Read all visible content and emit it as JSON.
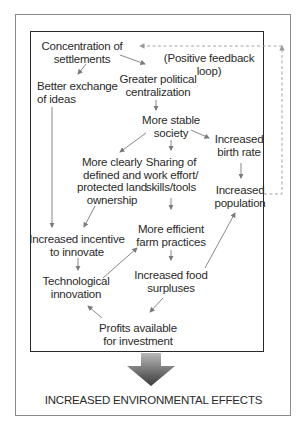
{
  "diagram": {
    "nodes": {
      "concentration": "Concentration of\nsettlements",
      "feedback_label": "(Positive feedback loop)",
      "better_exchange": "Better exchange\nof ideas",
      "political": "Greater political\ncentralization",
      "stable": "More stable\nsociety",
      "birth_rate": "Increased\nbirth rate",
      "land": "More clearly\ndefined and\nprotected land\nownership",
      "sharing": "Sharing of\nwork effort/\nskills/tools",
      "population": "Increased\npopulation",
      "incentive": "Increased incentive\nto innovate",
      "farm": "More efficient\nfarm practices",
      "tech": "Technological\ninnovation",
      "food": "Increased food\nsurpluses",
      "profits": "Profits available\nfor investment"
    },
    "outcome": "INCREASED ENVIRONMENTAL EFFECTS",
    "colors": {
      "text": "#2a2a2a",
      "arrow": "#7a7a7a",
      "feedback_dash": "#9a9a9a",
      "big_arrow_top": "#b0b0b0",
      "big_arrow_bottom": "#3a3a3a"
    }
  }
}
